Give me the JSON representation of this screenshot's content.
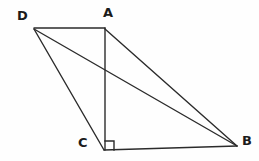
{
  "figure": {
    "kind": "geometry-diagram",
    "background_color": "#fefefe",
    "stroke_color": "#2b2b2b",
    "label_color": "#1b1b1b",
    "stroke_width": 1.4,
    "width": 259,
    "height": 161,
    "points": {
      "D": {
        "label": "D",
        "x": 34,
        "y": 28,
        "label_x": 17,
        "label_y": 9
      },
      "A": {
        "label": "A",
        "x": 105,
        "y": 28,
        "label_x": 103,
        "label_y": 6
      },
      "C": {
        "label": "C",
        "x": 105,
        "y": 148,
        "label_x": 78,
        "label_y": 136
      },
      "B": {
        "label": "B",
        "x": 236,
        "y": 145,
        "label_x": 242,
        "label_y": 134
      }
    },
    "segments": [
      {
        "name": "segment-DA",
        "from": "D",
        "to": "A",
        "x1": 34,
        "y1": 28,
        "x2": 105,
        "y2": 28
      },
      {
        "name": "segment-AC",
        "from": "A",
        "to": "C",
        "x1": 105,
        "y1": 28,
        "x2": 105,
        "y2": 150
      },
      {
        "name": "segment-CB",
        "from": "C",
        "to": "B",
        "x1": 104,
        "y1": 150,
        "x2": 237,
        "y2": 146
      },
      {
        "name": "segment-AB",
        "from": "A",
        "to": "B",
        "x1": 105,
        "y1": 29,
        "x2": 237,
        "y2": 146
      },
      {
        "name": "segment-DB",
        "from": "D",
        "to": "B",
        "x1": 34,
        "y1": 29,
        "x2": 237,
        "y2": 146
      },
      {
        "name": "segment-DC",
        "from": "D",
        "to": "C",
        "x1": 34,
        "y1": 29,
        "x2": 104,
        "y2": 150
      }
    ],
    "right_angle": {
      "name": "right-angle-marker-at-C",
      "at_vertex": "C",
      "size": 9,
      "points": "114,150 114,141 105,141"
    }
  }
}
